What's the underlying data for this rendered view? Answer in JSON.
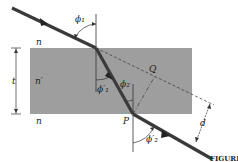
{
  "figure": {
    "caption": "FIGURE",
    "colors": {
      "slab": "#9e9e9e",
      "ray": "#3a3a3a",
      "line": "#333333",
      "background": "#ffffff"
    }
  },
  "labels": {
    "n_top": "n",
    "n_slab": "n′",
    "n_bottom": "n",
    "thickness": "t",
    "phi1": "ϕ₁",
    "phi1_prime": "ϕ′₁",
    "phi2": "ϕ₂",
    "phi2_prime": "ϕ′₂",
    "point_q": "Q",
    "point_p": "P",
    "offset": "d"
  }
}
